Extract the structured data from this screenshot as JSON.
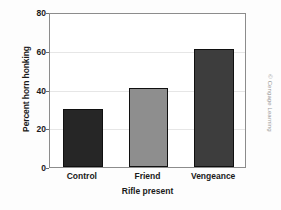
{
  "chart_data": {
    "type": "bar",
    "title": "",
    "subtitle": "",
    "xlabel": "Rifle present",
    "ylabel": "Percent horn honking",
    "categories": [
      "Control",
      "Friend",
      "Vengeance"
    ],
    "values": [
      30,
      41,
      61
    ],
    "series": [
      {
        "name": "Percent horn honking",
        "values": [
          30,
          41,
          61
        ]
      }
    ],
    "ylim": [
      0,
      80
    ],
    "yticks": [
      0,
      20,
      40,
      60,
      80
    ],
    "ytick_labels": [
      "0",
      "20",
      "40",
      "60",
      "80"
    ],
    "grid": "horizontal",
    "legend": "none",
    "bar_colors": [
      "#262626",
      "#8e8e8e",
      "#3d3d3d"
    ],
    "bar_edge_color": "#101010",
    "frame_color": "#8c8c8c",
    "gridline_color": "#e6e6e6",
    "plot_background": "#ffffff",
    "figure_background": "#fdfdfd",
    "text_color": "#1a1a1a"
  },
  "attribution": {
    "text": "© Cengage Learning",
    "color": "#9a9a9a"
  }
}
